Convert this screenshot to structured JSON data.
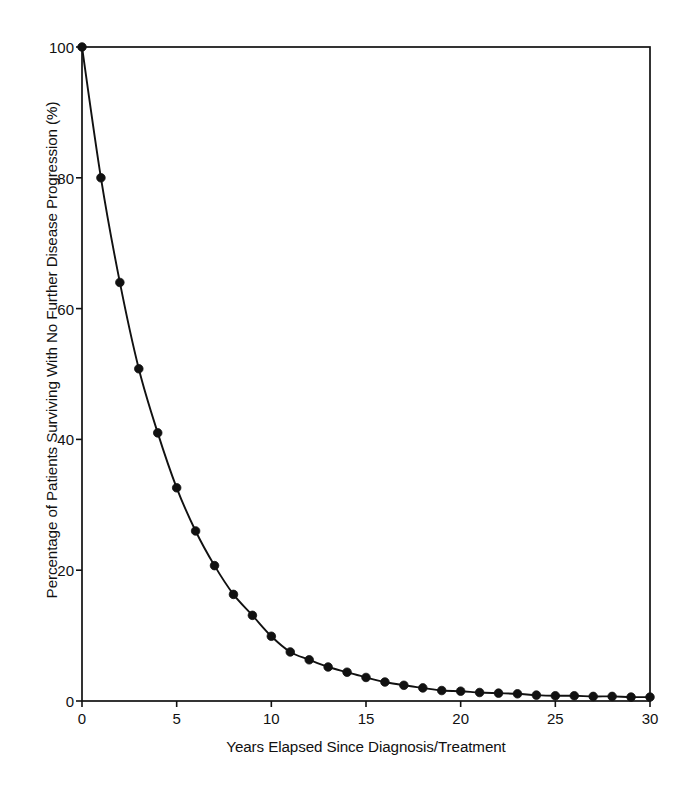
{
  "chart_data": {
    "type": "line",
    "title": "",
    "subtitle": "",
    "xlabel": "Years Elapsed Since Diagnosis/Treatment",
    "ylabel": "Percentage of Patients Surviving With No Further Disease Progression (%)",
    "xlim": [
      0,
      30
    ],
    "ylim": [
      0,
      100
    ],
    "xticks": [
      0,
      5,
      10,
      15,
      20,
      25,
      30
    ],
    "yticks": [
      0,
      20,
      40,
      60,
      80,
      100
    ],
    "xtick_labels": [
      "0",
      "5",
      "10",
      "15",
      "20",
      "25",
      "30"
    ],
    "ytick_labels": [
      "0",
      "20",
      "40",
      "60",
      "80",
      "100"
    ],
    "grid": false,
    "legend": "none",
    "frame": "box",
    "marker": "filled-circle",
    "line_color": "#111111",
    "marker_color": "#111111",
    "background": "#ffffff",
    "x": [
      0,
      1,
      2,
      3,
      4,
      5,
      6,
      7,
      8,
      9,
      10,
      11,
      12,
      13,
      14,
      15,
      16,
      17,
      18,
      19,
      20,
      21,
      22,
      23,
      24,
      25,
      26,
      27,
      28,
      29,
      30
    ],
    "values": [
      100,
      80,
      64,
      50.8,
      41,
      32.6,
      26,
      20.7,
      16.3,
      13.1,
      9.9,
      7.5,
      6.3,
      5.2,
      4.4,
      3.6,
      2.9,
      2.4,
      2,
      1.6,
      1.5,
      1.3,
      1.2,
      1.1,
      0.9,
      0.8,
      0.8,
      0.7,
      0.7,
      0.6,
      0.6
    ],
    "series": [
      {
        "name": "Percentage of patients surviving with no further disease progression",
        "values": [
          100,
          80,
          64,
          50.8,
          41,
          32.6,
          26,
          20.7,
          16.3,
          13.1,
          9.9,
          7.5,
          6.3,
          5.2,
          4.4,
          3.6,
          2.9,
          2.4,
          2,
          1.6,
          1.5,
          1.3,
          1.2,
          1.1,
          0.9,
          0.8,
          0.8,
          0.7,
          0.7,
          0.6,
          0.6
        ]
      }
    ],
    "annotations": []
  }
}
